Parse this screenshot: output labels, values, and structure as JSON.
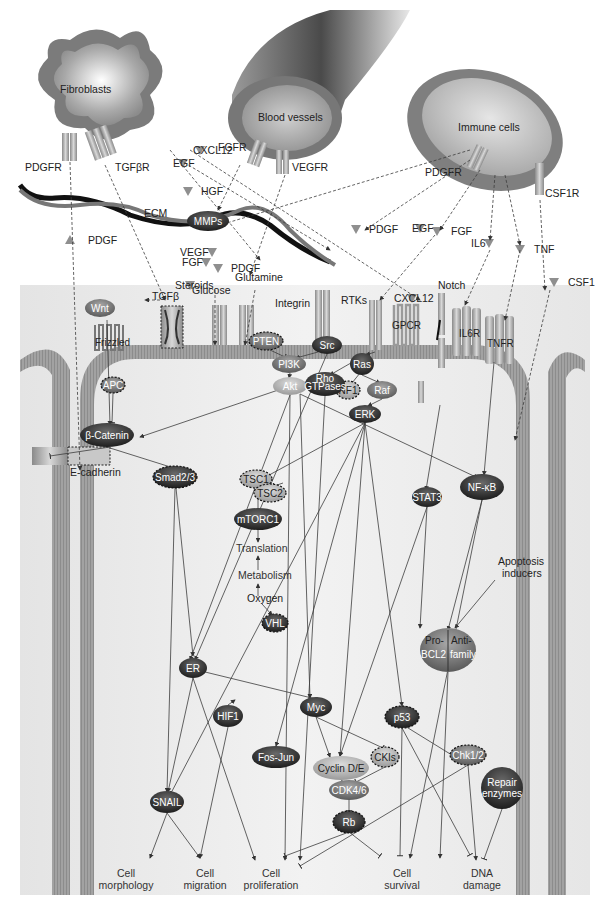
{
  "colors": {
    "background": "#ffffff",
    "cytoplasm": "#eeeeee",
    "membrane": "#9a9a9a",
    "node_dark": "#3a3a3a",
    "node_mid": "#7a7a7a",
    "node_light": "#b0b0b0",
    "ligand": "#8a8a8a",
    "edge": "#444444"
  },
  "cells": {
    "fibroblasts": "Fibroblasts",
    "blood_vessels": "Blood vessels",
    "immune_cells": "Immune cells"
  },
  "external_receptors": {
    "pdgfr_fibro": "PDGFR",
    "tgfbr": "TGFβR",
    "fgfr": "FGFR",
    "vegfr": "VEGFR",
    "pdgfr_immune": "PDGFR",
    "csf1r": "CSF1R"
  },
  "ligands": {
    "cxcl12_top": "CXCL12",
    "egf_top": "EGF",
    "hgf": "HGF",
    "pdgf_left": "PDGF",
    "vegf": "VEGF",
    "fgf_mid": "FGF",
    "pdgf_mid": "PDGF",
    "steroids": "Steroids",
    "pdgf_right": "PDGF",
    "egf_right": "EGF",
    "fgf_right": "FGF",
    "il6": "IL6",
    "tnf": "TNF",
    "csf1": "CSF1",
    "cxcl12_mid": "CXCL12",
    "tgfb": "TGFβ",
    "glucose": "Glucose",
    "glutamine": "Glutamine",
    "ecm": "ECM",
    "mmps_top": "MMPs"
  },
  "membrane_receptors": {
    "wnt": "Wnt",
    "frizzled": "Frizzled",
    "integrin": "Integrin",
    "rtks": "RTKs",
    "gpcr": "GPCR",
    "notch": "Notch",
    "il6r": "IL6R",
    "tnfr": "TNFR",
    "e_cadherin": "E-cadherin"
  },
  "nodes": {
    "mmps": "MMPs",
    "pten": "PTEN",
    "src": "Src",
    "pi3k": "PI3K",
    "rho_line1": "Rho",
    "rho_line2": "GTPases",
    "ras": "Ras",
    "akt": "Akt",
    "nf1": "NF1",
    "raf": "Raf",
    "apc": "APC",
    "b_catenin": "β-Catenin",
    "erk": "ERK",
    "smad": "Smad2/3",
    "tsc1": "TSC1",
    "tsc2": "TSC2",
    "mtorc1": "mTORC1",
    "stat3": "STAT3",
    "nfkb": "NF-κB",
    "vhl": "VHL",
    "er": "ER",
    "hif1": "HIF1",
    "myc": "Myc",
    "p53": "p53",
    "fos_jun": "Fos-Jun",
    "cyclin": "Cyclin D/E",
    "ckis": "CKIs",
    "chk": "Chk1/2",
    "cdk": "CDK4/6",
    "rb": "Rb",
    "snail": "SNAIL",
    "repair_line1": "Repair",
    "repair_line2": "enzymes",
    "bcl2_pro": "Pro-",
    "bcl2_anti": "Anti-",
    "bcl2_left": "BCL2",
    "bcl2_right": "family"
  },
  "processes": {
    "translation": "Translation",
    "metabolism": "Metabolism",
    "oxygen": "Oxygen",
    "apoptosis_line1": "Apoptosis",
    "apoptosis_line2": "inducers"
  },
  "outcomes": [
    {
      "line1": "Cell",
      "line2": "morphology"
    },
    {
      "line1": "Cell",
      "line2": "migration"
    },
    {
      "line1": "Cell",
      "line2": "proliferation"
    },
    {
      "line1": "Cell",
      "line2": "survival"
    },
    {
      "line1": "DNA",
      "line2": "damage"
    }
  ]
}
